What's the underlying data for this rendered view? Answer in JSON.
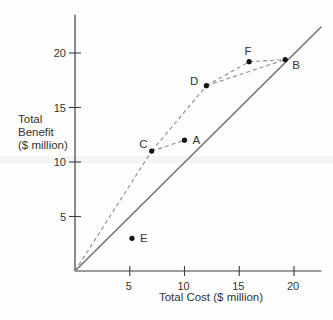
{
  "figure_title": "Cost-benefit scatter of alternative projects",
  "chart_data": {
    "type": "scatter",
    "title": "",
    "xlabel": "Total Cost ($ million)",
    "ylabel_lines": [
      "Total",
      "Benefit",
      "($ million)"
    ],
    "xlim": [
      0,
      22.5
    ],
    "ylim": [
      0,
      23.5
    ],
    "x_ticks": [
      5,
      10,
      15,
      20
    ],
    "y_ticks": [
      5,
      10,
      15,
      20
    ],
    "grid": false,
    "legend": "none",
    "points": [
      {
        "label": "A",
        "x": 10,
        "y": 12,
        "label_position": "right"
      },
      {
        "label": "B",
        "x": 19.2,
        "y": 19.4,
        "label_position": "below-right"
      },
      {
        "label": "C",
        "x": 7,
        "y": 11,
        "label_position": "above-left"
      },
      {
        "label": "D",
        "x": 12,
        "y": 17,
        "label_position": "left"
      },
      {
        "label": "E",
        "x": 5.2,
        "y": 3,
        "label_position": "right"
      },
      {
        "label": "F",
        "x": 15.9,
        "y": 19.2,
        "label_position": "above"
      }
    ],
    "solid_line": {
      "name": "benefit-equals-cost-45-degree-line",
      "from": [
        0,
        0
      ],
      "to": [
        22.5,
        22.4
      ]
    },
    "dashed_segments": [
      {
        "from": "origin",
        "to": "C"
      },
      {
        "from": "C",
        "to": "A"
      },
      {
        "from": "C",
        "to": "D"
      },
      {
        "from": "D",
        "to": "F"
      },
      {
        "from": "D",
        "to": "B"
      },
      {
        "from": "F",
        "to": "B"
      }
    ],
    "colors": {
      "axis": "#3d3d3d",
      "solid_line": "#6b6b6b",
      "dashed_line": "#8a8a8a",
      "point": "#141414",
      "text": "#333333"
    }
  }
}
